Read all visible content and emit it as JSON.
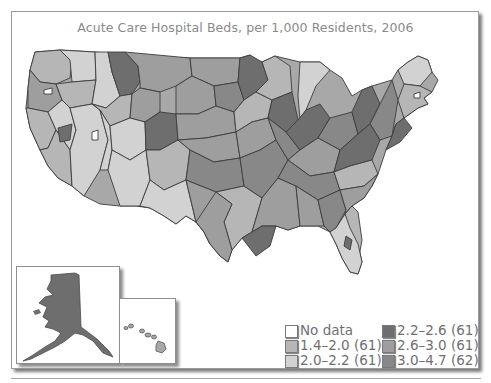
{
  "title": "Acute Care Hospital Beds, per 1,000 Residents, 2006",
  "colors": {
    "no_data": "#ffffff",
    "c1": "#b6b6b6",
    "c2": "#d2d2d2",
    "c3": "#6e6e6e",
    "c4": "#9e9e9e",
    "c5": "#888888",
    "border": "#3a3a3a",
    "frame": "#9a9a9a"
  },
  "legend": {
    "items": [
      {
        "label": "No data",
        "color": "#ffffff"
      },
      {
        "label": "1.4–2.0 (61)",
        "color": "#b6b6b6"
      },
      {
        "label": "2.0–2.2 (61)",
        "color": "#d2d2d2"
      },
      {
        "label": "2.2–2.6 (61)",
        "color": "#6e6e6e"
      },
      {
        "label": "2.6–3.0 (61)",
        "color": "#9e9e9e"
      },
      {
        "label": "3.0–4.7 (62)",
        "color": "#888888"
      }
    ]
  },
  "insets": [
    {
      "name": "Alaska"
    },
    {
      "name": "Hawaii"
    }
  ]
}
